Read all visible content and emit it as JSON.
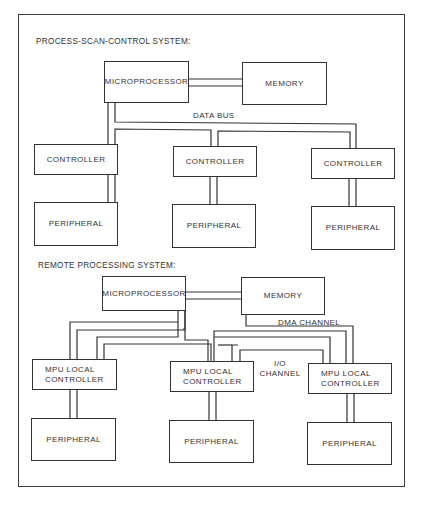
{
  "diagram": {
    "sections": [
      {
        "title": "PROCESS-SCAN-CONTROL SYSTEM:",
        "microprocessor": "MICROPROCESSOR",
        "memory": "MEMORY",
        "bus_label": "DATA BUS",
        "controllers": [
          "CONTROLLER",
          "CONTROLLER",
          "CONTROLLER"
        ],
        "peripherals": [
          "PERIPHERAL",
          "PERIPHERAL",
          "PERIPHERAL"
        ]
      },
      {
        "title": "REMOTE PROCESSING SYSTEM:",
        "microprocessor": "MICROPROCESSOR",
        "memory": "MEMORY",
        "dma_label": "DMA CHANNEL",
        "io_label": "I/O\nCHANNEL",
        "controllers": [
          "MPU LOCAL\nCONTROLLER",
          "MPU LOCAL\nCONTROLLER",
          "MPU LOCAL\nCONTROLLER"
        ],
        "peripherals": [
          "PERIPHERAL",
          "PERIPHERAL",
          "PERIPHERAL"
        ]
      }
    ]
  }
}
